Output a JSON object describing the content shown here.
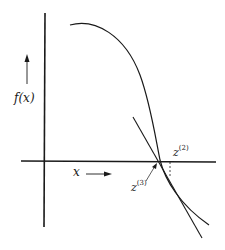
{
  "figure": {
    "y_axis_label": "f(x)",
    "x_axis_label": "x",
    "points": [
      {
        "base": "z",
        "sup": "(2)"
      },
      {
        "base": "z",
        "sup": "(3)"
      }
    ],
    "colors": {
      "ink": "#1a1a1a",
      "background": "#ffffff"
    }
  }
}
